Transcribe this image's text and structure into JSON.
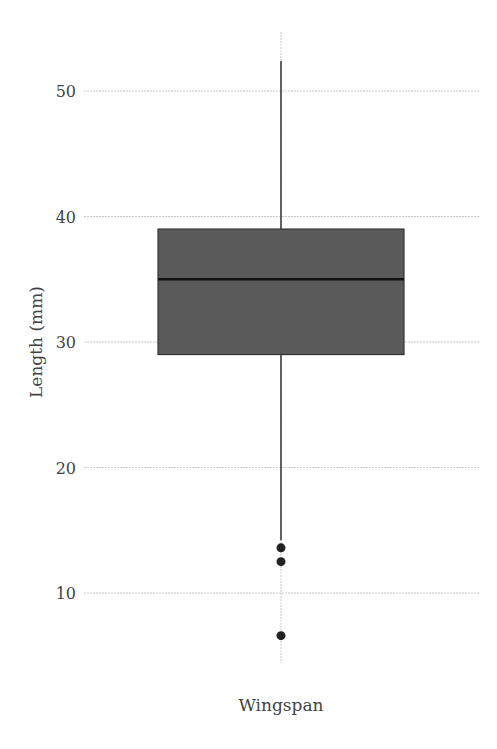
{
  "chart_data": {
    "type": "box",
    "title": "",
    "xlabel": "",
    "ylabel": "Length (mm)",
    "categories": [
      "Wingspan"
    ],
    "series": [
      {
        "name": "Wingspan",
        "whisker_low": 14.2,
        "q1": 29,
        "median": 35,
        "q3": 39,
        "whisker_high": 52.4,
        "outliers": [
          13.6,
          12.5,
          6.6
        ]
      }
    ],
    "yticks": [
      10,
      20,
      30,
      40,
      50
    ],
    "ytick_labels": [
      "10",
      "20",
      "30",
      "40",
      "50"
    ],
    "ylim": [
      4.2,
      54.6
    ],
    "grid": true,
    "legend": null
  },
  "colors": {
    "box_fill": "#5a5a5a",
    "box_outline": "#333333",
    "median_line": "#111111",
    "whisker": "#333333",
    "outlier": "#222222",
    "grid": "#c8c8c8",
    "text": "#444444"
  }
}
